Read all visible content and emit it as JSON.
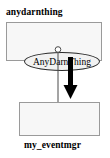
{
  "diagram": {
    "type": "uml-package-dependency",
    "background_color": "#ffffff",
    "packages": [
      {
        "id": "anydarnthing",
        "label": "anydarnthing",
        "label_position": "top",
        "border_color": "#9a9a9a",
        "fill_color": "#f7f7f7",
        "classes": [
          {
            "id": "AnyDarnThing",
            "name": "AnyDarnThing",
            "shape": "rounded-rectangle",
            "border_color": "#2b2b2b",
            "fill_color": "#f2f2f2"
          }
        ]
      },
      {
        "id": "my_eventmgr",
        "label": "my_eventmgr",
        "label_position": "bottom",
        "border_color": "#9a9a9a",
        "fill_color": "#f7f7f7",
        "classes": [
          {
            "id": "EventMgr",
            "name": "EventMgr",
            "shape": "rounded-rectangle",
            "border_color": "#2b2b2b",
            "fill_color": "#f2f2f2"
          }
        ]
      }
    ],
    "edges": [
      {
        "id": "lollipop-connector",
        "from": "AnyDarnThing",
        "to": "my_eventmgr",
        "style": "thin-line-with-circle-endpoint",
        "endpoint_shape": "circle",
        "color": "#4a4a4a",
        "line_width": 1
      },
      {
        "id": "dependency-arrow",
        "from": "anydarnthing",
        "to": "my_eventmgr",
        "style": "thick-solid-arrow",
        "arrowhead": "filled-triangle",
        "color": "#000000",
        "line_width": 5
      }
    ]
  }
}
